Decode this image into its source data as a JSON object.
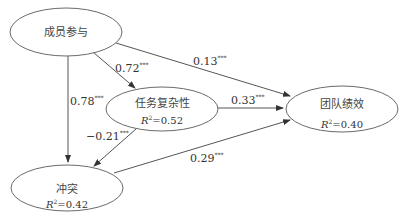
{
  "diagram": {
    "type": "path-model",
    "nodes": [
      {
        "id": "participation",
        "label": "成员参与",
        "r2": null
      },
      {
        "id": "complexity",
        "label": "任务复杂性",
        "r2_prefix": "R",
        "r2_sup": "2",
        "r2_value": "=0.52"
      },
      {
        "id": "performance",
        "label": "团队绩效",
        "r2_prefix": "R",
        "r2_sup": "2",
        "r2_value": "=0.40"
      },
      {
        "id": "conflict",
        "label": "冲突",
        "r2_prefix": "R",
        "r2_sup": "2",
        "r2_value": "=0.42"
      }
    ],
    "edges": [
      {
        "from": "participation",
        "to": "complexity",
        "coef": "0.72",
        "sig": "***"
      },
      {
        "from": "participation",
        "to": "performance",
        "coef": "0.13",
        "sig": "***"
      },
      {
        "from": "participation",
        "to": "conflict",
        "coef": "0.78",
        "sig": "***"
      },
      {
        "from": "complexity",
        "to": "performance",
        "coef": "0.33",
        "sig": "***"
      },
      {
        "from": "complexity",
        "to": "conflict",
        "coef": "−0.21",
        "sig": "***"
      },
      {
        "from": "conflict",
        "to": "performance",
        "coef": "0.29",
        "sig": "***"
      }
    ]
  }
}
